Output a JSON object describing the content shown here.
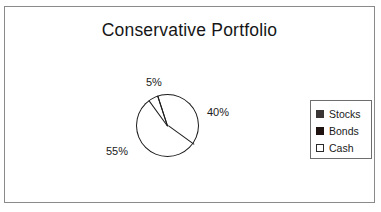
{
  "chart_data": {
    "type": "pie",
    "title": "Conservative Portfolio",
    "categories": [
      "Stocks",
      "Bonds",
      "Cash"
    ],
    "values": [
      40,
      55,
      5
    ],
    "value_unit": "%",
    "data_labels": [
      "40%",
      "55%",
      "5%"
    ],
    "colors": [
      "#3a3635",
      "#1f1210",
      "#ffffff"
    ],
    "slice_edge_color": "#1a1a1a",
    "start_angle_deg": -18,
    "legend": {
      "position": "right",
      "entries": [
        {
          "label": "Stocks",
          "swatch_color": "#3a3635",
          "swatch_border": "#3a3635"
        },
        {
          "label": "Bonds",
          "swatch_color": "#1f1210",
          "swatch_border": "#1f1210"
        },
        {
          "label": "Cash",
          "swatch_color": "#ffffff",
          "swatch_border": "#2a2a2a"
        }
      ]
    },
    "grid": false,
    "xlabel": "",
    "ylabel": "",
    "background": "#ffffff",
    "frame_border_color": "#8a8a8a"
  },
  "labels": {
    "cash_pct": "5%",
    "stocks_pct": "40%",
    "bonds_pct": "55%"
  }
}
